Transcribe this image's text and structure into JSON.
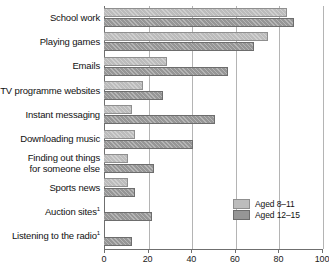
{
  "chart_data": {
    "type": "bar",
    "orientation": "horizontal",
    "title": "",
    "xlabel": "",
    "ylabel": "",
    "xlim": [
      0,
      100
    ],
    "xticks": [
      0,
      20,
      40,
      60,
      80,
      100
    ],
    "grid": true,
    "legend_position": "bottom-right",
    "categories": [
      "School work",
      "Playing games",
      "Emails",
      "TV programme websites",
      "Instant messaging",
      "Downloading music",
      "Finding out things\nfor someone else",
      "Sports news",
      "Auction sites",
      "Listening to the radio"
    ],
    "category_footnotes": [
      "",
      "",
      "",
      "",
      "",
      "",
      "",
      "",
      "1",
      "1"
    ],
    "series": [
      {
        "name": "Aged 8–11",
        "color": "#bcbcbc",
        "values": [
          84,
          75,
          29,
          18,
          13,
          14,
          11,
          11,
          null,
          null
        ]
      },
      {
        "name": "Aged 12–15",
        "color": "#969696",
        "values": [
          87,
          69,
          57,
          27,
          51,
          41,
          23,
          14,
          22,
          13
        ]
      }
    ]
  },
  "legend": {
    "items": [
      {
        "label": "Aged 8–11"
      },
      {
        "label": "Aged 12–15"
      }
    ]
  },
  "axis": {
    "ticks": [
      "0",
      "20",
      "40",
      "60",
      "80",
      "100"
    ]
  }
}
